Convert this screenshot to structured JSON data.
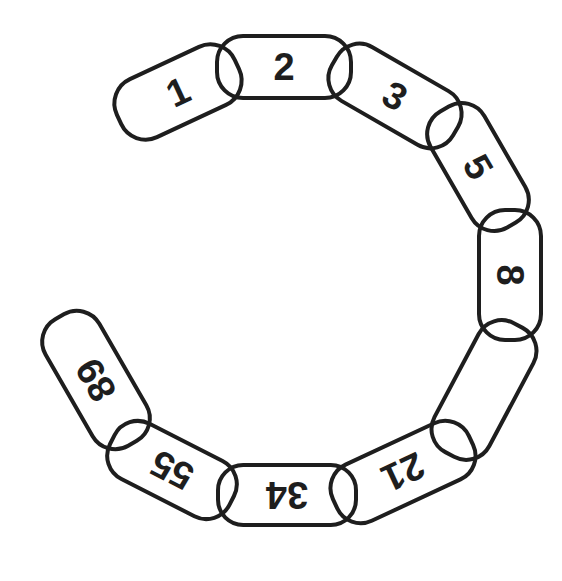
{
  "diagram": {
    "title": "",
    "stroke_color": "#1e1e1e",
    "fill_color": "#ffffff",
    "links": [
      {
        "label": "1",
        "cx": 178,
        "cy": 92,
        "len": 130,
        "wid": 64,
        "angle": -25
      },
      {
        "label": "2",
        "cx": 284,
        "cy": 67,
        "len": 134,
        "wid": 62,
        "angle": 0
      },
      {
        "label": "3",
        "cx": 395,
        "cy": 96,
        "len": 140,
        "wid": 62,
        "angle": 30
      },
      {
        "label": "5",
        "cx": 478,
        "cy": 167,
        "len": 134,
        "wid": 62,
        "angle": 60
      },
      {
        "label": "8",
        "cx": 510,
        "cy": 275,
        "len": 130,
        "wid": 62,
        "angle": 90
      },
      {
        "label": "",
        "cx": 484,
        "cy": 390,
        "len": 146,
        "wid": 62,
        "angle": 118
      },
      {
        "label": "21",
        "cx": 403,
        "cy": 472,
        "len": 150,
        "wid": 62,
        "angle": 155
      },
      {
        "label": "34",
        "cx": 287,
        "cy": 495,
        "len": 138,
        "wid": 60,
        "angle": 180
      },
      {
        "label": "55",
        "cx": 172,
        "cy": 470,
        "len": 134,
        "wid": 62,
        "angle": 207
      },
      {
        "label": "89",
        "cx": 96,
        "cy": 380,
        "len": 146,
        "wid": 62,
        "angle": 240
      }
    ]
  }
}
